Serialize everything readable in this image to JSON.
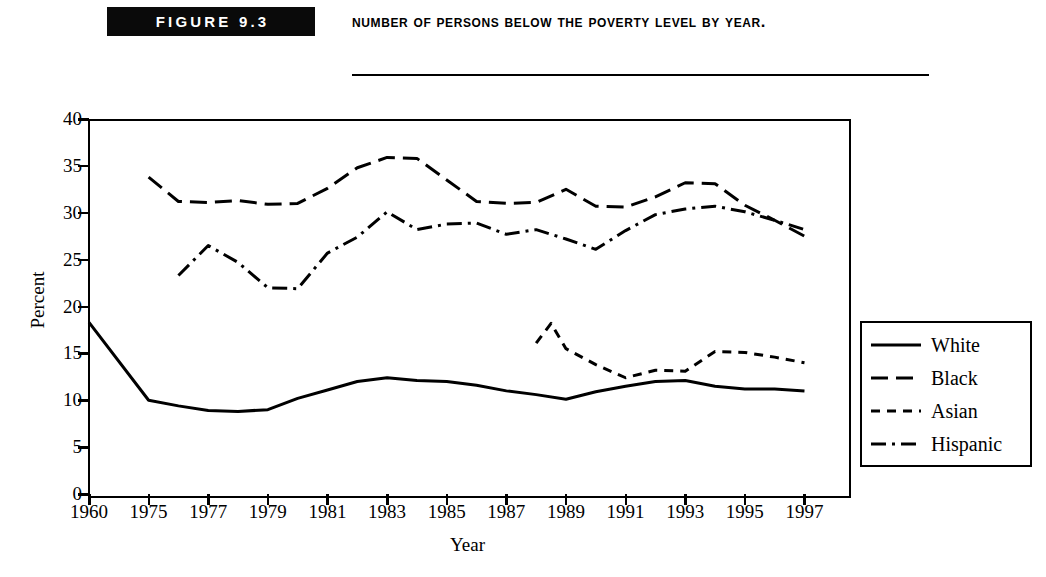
{
  "figure": {
    "badge_label": "FIGURE 9.3",
    "title": "Number of Persons Below the Poverty Level by Year."
  },
  "chart_data": {
    "type": "line",
    "title": "Number of Persons Below the Poverty Level by Year.",
    "xlabel": "Year",
    "ylabel": "Percent",
    "ylim": [
      0,
      40
    ],
    "yticks": [
      0,
      5,
      10,
      15,
      20,
      25,
      30,
      35,
      40
    ],
    "xticks": [
      "1960",
      "1975",
      "1977",
      "1979",
      "1981",
      "1983",
      "1985",
      "1987",
      "1989",
      "1991",
      "1993",
      "1995",
      "1997"
    ],
    "grid": false,
    "legend_position": "right-outside",
    "series": [
      {
        "name": "White",
        "style": "solid",
        "x": [
          1960,
          1975,
          1976,
          1977,
          1978,
          1979,
          1980,
          1981,
          1982,
          1983,
          1984,
          1985,
          1986,
          1987,
          1988,
          1989,
          1990,
          1991,
          1992,
          1993,
          1994,
          1995,
          1996,
          1997
        ],
        "values": [
          18.3,
          10.0,
          9.4,
          8.9,
          8.8,
          9.0,
          10.2,
          11.1,
          12.0,
          12.4,
          12.1,
          12.0,
          11.6,
          11.0,
          10.6,
          10.1,
          10.9,
          11.5,
          12.0,
          12.1,
          11.5,
          11.2,
          11.2,
          11.0
        ]
      },
      {
        "name": "Black",
        "style": "dashed-long",
        "x": [
          1975,
          1976,
          1977,
          1978,
          1979,
          1980,
          1981,
          1982,
          1983,
          1984,
          1985,
          1986,
          1987,
          1988,
          1989,
          1990,
          1991,
          1992,
          1993,
          1994,
          1995,
          1996,
          1997
        ],
        "values": [
          33.8,
          31.2,
          31.1,
          31.3,
          30.9,
          31.0,
          32.6,
          34.8,
          35.9,
          35.8,
          33.5,
          31.2,
          31.0,
          31.1,
          32.5,
          30.7,
          30.6,
          31.7,
          33.2,
          33.1,
          30.8,
          29.2,
          27.5
        ]
      },
      {
        "name": "Asian",
        "style": "dashed-short",
        "x": [
          1988,
          1988.5,
          1989,
          1990,
          1991,
          1992,
          1993,
          1994,
          1995,
          1996,
          1997
        ],
        "values": [
          16.1,
          18.2,
          15.5,
          13.8,
          12.4,
          13.2,
          13.1,
          15.2,
          15.1,
          14.6,
          14.0
        ]
      },
      {
        "name": "Hispanic",
        "style": "dash-dot",
        "x": [
          1976,
          1977,
          1978,
          1979,
          1980,
          1981,
          1982,
          1983,
          1984,
          1985,
          1986,
          1987,
          1988,
          1989,
          1990,
          1991,
          1992,
          1993,
          1994,
          1995,
          1996,
          1997
        ],
        "values": [
          23.3,
          26.5,
          24.7,
          22.0,
          21.9,
          25.7,
          27.4,
          30.1,
          28.2,
          28.8,
          28.9,
          27.7,
          28.2,
          27.2,
          26.1,
          28.1,
          29.8,
          30.4,
          30.7,
          30.1,
          29.2,
          28.2
        ]
      }
    ]
  },
  "legend": {
    "items": [
      {
        "label": "White",
        "style": "solid"
      },
      {
        "label": "Black",
        "style": "dashed-long"
      },
      {
        "label": "Asian",
        "style": "dashed-short"
      },
      {
        "label": "Hispanic",
        "style": "dash-dot"
      }
    ]
  }
}
